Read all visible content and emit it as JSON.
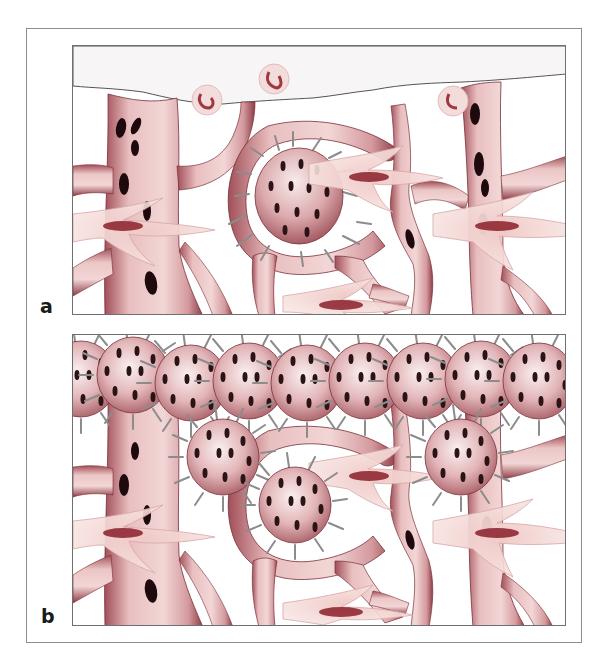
{
  "figure": {
    "panels": [
      {
        "id": "a",
        "label": "a"
      },
      {
        "id": "b",
        "label": "b"
      }
    ]
  },
  "colors": {
    "vessel_fill": "#e8bcbc",
    "vessel_light": "#f4dede",
    "vessel_shade": "#9e4a52",
    "vessel_outline": "#7a2f38",
    "lumen_dark": "#1e0a0c",
    "tumor_cell_fill": "#d9a5a8",
    "tumor_cell_light": "#f6e6e6",
    "tumor_spot": "#2a1416",
    "filopodia": "#8c8c8c",
    "pericyte_fill": "#f3d9d6",
    "pericyte_nucleus": "#8b1e2a",
    "pial_surface": "#f7f5f5",
    "rbc_ring": "#f1d2d2",
    "rbc_core": "#a0383e",
    "frame_border": "#8e8e8e",
    "panel_border": "#6f6f6f",
    "label_color": "#1a1a1a"
  }
}
